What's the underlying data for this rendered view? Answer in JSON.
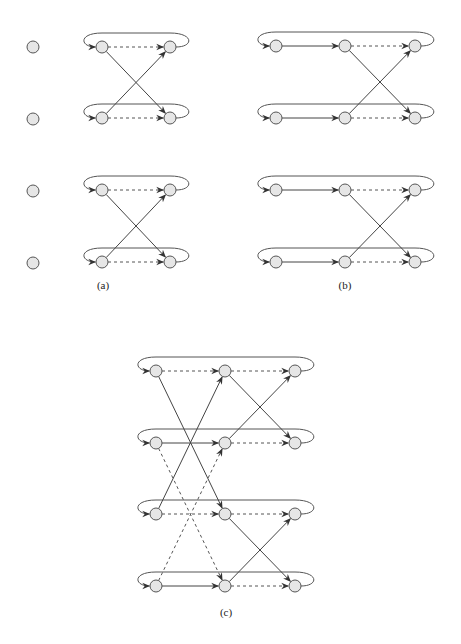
{
  "figure": {
    "panels": [
      {
        "id": "a",
        "label": "(a)",
        "label_pos": [
          103,
          289
        ],
        "isolated_nodes": [
          [
            33,
            47
          ],
          [
            33,
            119
          ],
          [
            33,
            191
          ],
          [
            33,
            263
          ]
        ],
        "columns_x": [
          102,
          170
        ],
        "rows_y": [
          47,
          118,
          190,
          262
        ],
        "groups": [
          {
            "rows": [
              0,
              1
            ],
            "loops": [
              0,
              1
            ]
          },
          {
            "rows": [
              2,
              3
            ],
            "loops": [
              2,
              3
            ]
          }
        ],
        "row_edges": [
          {
            "row": 0,
            "from": 0,
            "to": 1,
            "style": "dashed"
          },
          {
            "row": 1,
            "from": 0,
            "to": 1,
            "style": "dashed"
          },
          {
            "row": 2,
            "from": 0,
            "to": 1,
            "style": "dashed"
          },
          {
            "row": 3,
            "from": 0,
            "to": 1,
            "style": "dashed"
          }
        ],
        "cross_edges": [
          {
            "from": [
              0,
              0
            ],
            "to": [
              1,
              1
            ],
            "style": "solid"
          },
          {
            "from": [
              1,
              0
            ],
            "to": [
              0,
              1
            ],
            "style": "solid"
          },
          {
            "from": [
              2,
              0
            ],
            "to": [
              3,
              1
            ],
            "style": "solid"
          },
          {
            "from": [
              3,
              0
            ],
            "to": [
              2,
              1
            ],
            "style": "solid"
          }
        ]
      },
      {
        "id": "b",
        "label": "(b)",
        "label_pos": [
          345,
          289
        ],
        "isolated_nodes": [],
        "columns_x": [
          276,
          345,
          415
        ],
        "rows_y": [
          46,
          118,
          190,
          262
        ],
        "row_edges": [
          {
            "row": 0,
            "from": 0,
            "to": 1,
            "style": "solid"
          },
          {
            "row": 0,
            "from": 1,
            "to": 2,
            "style": "dashed"
          },
          {
            "row": 1,
            "from": 0,
            "to": 1,
            "style": "solid"
          },
          {
            "row": 1,
            "from": 1,
            "to": 2,
            "style": "dashed"
          },
          {
            "row": 2,
            "from": 0,
            "to": 1,
            "style": "solid"
          },
          {
            "row": 2,
            "from": 1,
            "to": 2,
            "style": "dashed"
          },
          {
            "row": 3,
            "from": 0,
            "to": 1,
            "style": "solid"
          },
          {
            "row": 3,
            "from": 1,
            "to": 2,
            "style": "dashed"
          }
        ],
        "cross_edges": [
          {
            "from": [
              0,
              1
            ],
            "to": [
              1,
              2
            ],
            "style": "solid"
          },
          {
            "from": [
              1,
              1
            ],
            "to": [
              0,
              2
            ],
            "style": "solid"
          },
          {
            "from": [
              2,
              1
            ],
            "to": [
              3,
              2
            ],
            "style": "solid"
          },
          {
            "from": [
              3,
              1
            ],
            "to": [
              2,
              2
            ],
            "style": "solid"
          }
        ]
      },
      {
        "id": "c",
        "label": "(c)",
        "label_pos": [
          226,
          616
        ],
        "isolated_nodes": [],
        "columns_x": [
          156,
          225,
          295
        ],
        "rows_y": [
          371,
          443,
          514,
          586
        ],
        "row_edges": [
          {
            "row": 0,
            "from": 0,
            "to": 1,
            "style": "dashed"
          },
          {
            "row": 0,
            "from": 1,
            "to": 2,
            "style": "dashed"
          },
          {
            "row": 1,
            "from": 0,
            "to": 1,
            "style": "solid"
          },
          {
            "row": 1,
            "from": 1,
            "to": 2,
            "style": "dashed"
          },
          {
            "row": 2,
            "from": 0,
            "to": 1,
            "style": "dashed"
          },
          {
            "row": 2,
            "from": 1,
            "to": 2,
            "style": "dashed"
          },
          {
            "row": 3,
            "from": 0,
            "to": 1,
            "style": "solid"
          },
          {
            "row": 3,
            "from": 1,
            "to": 2,
            "style": "dashed"
          }
        ],
        "cross_edges": [
          {
            "from": [
              0,
              0
            ],
            "to": [
              2,
              1
            ],
            "style": "solid"
          },
          {
            "from": [
              2,
              0
            ],
            "to": [
              0,
              1
            ],
            "style": "solid"
          },
          {
            "from": [
              0,
              1
            ],
            "to": [
              1,
              2
            ],
            "style": "solid"
          },
          {
            "from": [
              1,
              1
            ],
            "to": [
              0,
              2
            ],
            "style": "solid"
          },
          {
            "from": [
              2,
              1
            ],
            "to": [
              3,
              2
            ],
            "style": "solid"
          },
          {
            "from": [
              3,
              1
            ],
            "to": [
              2,
              2
            ],
            "style": "solid"
          },
          {
            "from": [
              1,
              0
            ],
            "to": [
              3,
              1
            ],
            "style": "dashed"
          },
          {
            "from": [
              3,
              0
            ],
            "to": [
              1,
              1
            ],
            "style": "dashed"
          }
        ]
      }
    ],
    "node_radius": 6,
    "colors": {
      "node_fill": "#e6e6e6",
      "node_stroke": "#555555",
      "edge": "#444444"
    }
  }
}
